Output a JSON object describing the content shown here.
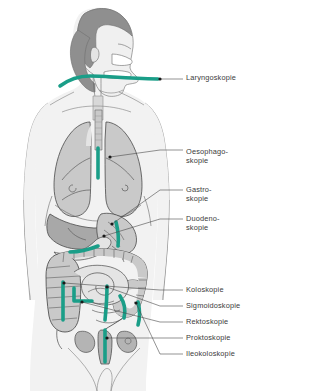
{
  "figure": {
    "language": "de",
    "background_color": "#ffffff",
    "body_fill": "#f2f2f2",
    "body_outline": "#8c8c8c",
    "organ_fill": "#c9c9c9",
    "organ_fill_dark": "#a8a8a8",
    "organ_fill_light": "#e4e4e4",
    "hair_fill": "#8f8f8f",
    "organ_outline": "#4a4a4a",
    "scope_color": "#1a9e88",
    "marker_color": "#1a1a1a",
    "leader_color": "#4a4a4a",
    "label_color": "#3b3b3b"
  },
  "labels": [
    {
      "id": "laryngoskopie",
      "text": "Laryngoskopie",
      "x": 186,
      "y": 74,
      "marker_x": 160,
      "marker_y": 79,
      "leader": "M160,79 L183,79"
    },
    {
      "id": "oesophagoskopie",
      "text": "Oesophago-\nskopie",
      "x": 186,
      "y": 148,
      "marker_x": 110,
      "marker_y": 157,
      "leader": "M110,157 L160,150 L183,150"
    },
    {
      "id": "gastroskopie",
      "text": "Gastro-\nskopie",
      "x": 186,
      "y": 186,
      "marker_x": 112,
      "marker_y": 224,
      "leader": "M112,224 L160,190 L183,190"
    },
    {
      "id": "duodenoskopie",
      "text": "Duodeno-\nskopie",
      "x": 186,
      "y": 215,
      "marker_x": 104,
      "marker_y": 236,
      "leader": "M104,236 L160,219 L183,219"
    },
    {
      "id": "koloskopie",
      "text": "Koloskopie",
      "x": 186,
      "y": 286,
      "marker_x": 64,
      "marker_y": 283,
      "leader": "M64,283 L160,290 L183,290"
    },
    {
      "id": "sigmoidoskopie",
      "text": "Sigmoidoskopie",
      "x": 186,
      "y": 302,
      "marker_x": 107,
      "marker_y": 287,
      "leader": "M107,287 L160,306 L183,306"
    },
    {
      "id": "rektoskopie",
      "text": "Rektoskopie",
      "x": 186,
      "y": 318,
      "marker_x": 82,
      "marker_y": 302,
      "leader": "M82,302 L160,322 L183,322"
    },
    {
      "id": "proktoskopie",
      "text": "Proktoskopie",
      "x": 186,
      "y": 334,
      "marker_x": 107,
      "marker_y": 338,
      "leader": "M107,338 L160,338 L183,338"
    },
    {
      "id": "ileokoloskopie",
      "text": "Ileokoloskopie",
      "x": 186,
      "y": 350,
      "marker_x": 136,
      "marker_y": 303,
      "leader": "M136,303 L160,354 L183,354"
    }
  ],
  "scopes": [
    {
      "id": "scope-larynx",
      "region": "larynx / throat"
    },
    {
      "id": "scope-esophagus",
      "region": "esophagus"
    },
    {
      "id": "scope-stomach",
      "region": "stomach"
    },
    {
      "id": "scope-duodenum",
      "region": "duodenum"
    },
    {
      "id": "scope-colon-asc",
      "region": "ascending colon"
    },
    {
      "id": "scope-colon-hook",
      "region": "transverse colon hook"
    },
    {
      "id": "scope-colon-desc",
      "region": "descending colon"
    },
    {
      "id": "scope-sigmoid",
      "region": "sigmoid colon"
    },
    {
      "id": "scope-rectum",
      "region": "rectum"
    },
    {
      "id": "scope-ileum",
      "region": "terminal ileum"
    }
  ]
}
